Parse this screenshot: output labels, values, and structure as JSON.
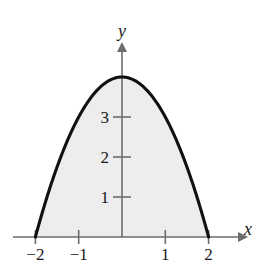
{
  "figure": {
    "background_color": "#ffffff",
    "curve_color": "#111111",
    "axis_color": "#6d6d6d",
    "fill_color": "#ededed",
    "label_color": "#1a1a1a"
  },
  "axes": {
    "x_name": "x",
    "y_name": "y",
    "origin_px": {
      "x": 122,
      "y": 237
    },
    "x_scale_px_per_unit": 43.3,
    "y_scale_px_per_unit": 40,
    "x_axis_start_px": 13,
    "x_axis_end_px": 243,
    "y_axis_top_px": 47,
    "x_ticks": [
      {
        "value": -2,
        "label": "−2",
        "px": 35.4
      },
      {
        "value": -1,
        "label": "−1",
        "px": 78.7
      },
      {
        "value": 1,
        "label": "1",
        "px": 165.3
      },
      {
        "value": 2,
        "label": "2",
        "px": 208.6
      }
    ],
    "y_ticks": [
      {
        "value": 1,
        "label": "1",
        "px": 197
      },
      {
        "value": 2,
        "label": "2",
        "px": 157
      },
      {
        "value": 3,
        "label": "3",
        "px": 117
      }
    ]
  },
  "chart_data": {
    "type": "line",
    "title": "",
    "subtitle": "",
    "xlabel": "x",
    "ylabel": "y",
    "xlim": [
      -2.52,
      2.79
    ],
    "ylim": [
      -0.1,
      4.75
    ],
    "grid": false,
    "legend": null,
    "annotations": [],
    "xticks": [
      -2,
      -1,
      1,
      2
    ],
    "xticklabels": [
      "−2",
      "−1",
      "1",
      "2"
    ],
    "yticks": [
      1,
      2,
      3
    ],
    "yticklabels": [
      "1",
      "2",
      "3"
    ],
    "series": [
      {
        "name": "y = 4 - x^2",
        "equation": "y = 4 − x²",
        "vertex": [
          0,
          4
        ],
        "roots": [
          -2,
          2
        ],
        "shaded_region": {
          "between": "curve and x-axis",
          "x_from": -2,
          "x_to": 2,
          "fill": "#ededed"
        },
        "x": [
          -2,
          -1.8,
          -1.6,
          -1.4,
          -1.2,
          -1,
          -0.8,
          -0.6,
          -0.4,
          -0.2,
          0,
          0.2,
          0.4,
          0.6,
          0.8,
          1,
          1.2,
          1.4,
          1.6,
          1.8,
          2
        ],
        "y": [
          0,
          0.76,
          1.44,
          2.04,
          2.56,
          3,
          3.36,
          3.64,
          3.84,
          3.96,
          4,
          3.96,
          3.84,
          3.64,
          3.36,
          3,
          2.56,
          2.04,
          1.44,
          0.76,
          0
        ]
      }
    ]
  }
}
